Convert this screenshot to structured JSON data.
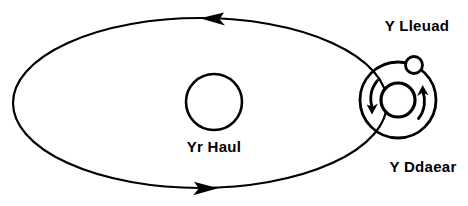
{
  "diagram": {
    "language": "cy",
    "background_color": "#ffffff",
    "stroke_color": "#000000",
    "canvas": {
      "width": 468,
      "height": 206
    },
    "labels": {
      "sun": "Yr Haul",
      "earth": "Y Ddaear",
      "moon": "Y Lleuad"
    },
    "bodies": {
      "sun": {
        "name": "sun",
        "label": "Yr Haul",
        "cx": 214,
        "cy": 102,
        "r": 28,
        "stroke_width": 2.6,
        "label_x": 214,
        "label_y": 152
      },
      "earth": {
        "name": "earth",
        "label": "Y Ddaear",
        "cx": 398,
        "cy": 100,
        "r": 17,
        "stroke_width": 3.2,
        "label_x": 423,
        "label_y": 172
      },
      "moon": {
        "name": "moon",
        "label": "Y Lleuad",
        "cx": 414,
        "cy": 65,
        "r": 8.5,
        "stroke_width": 2.8,
        "label_x": 417,
        "label_y": 31
      }
    },
    "orbits": {
      "earth_orbit": {
        "name": "earth-orbit-ellipse",
        "shape": "ellipse",
        "cx": 200,
        "cy": 103,
        "rx": 187,
        "ry": 85,
        "stroke_width": 2.2,
        "direction": "counterclockwise",
        "arrow_top": {
          "x": 212,
          "y": 18,
          "points": "left"
        },
        "arrow_bottom": {
          "x": 205,
          "y": 188,
          "points": "right"
        }
      },
      "moon_orbit": {
        "name": "moon-orbit-circle",
        "shape": "circle",
        "cx": 398,
        "cy": 100,
        "r": 38,
        "stroke_width": 2.8,
        "direction": "counterclockwise"
      }
    },
    "rotation_arrows": [
      {
        "name": "earth-rotation-arrow-left",
        "side": "left",
        "points": "down",
        "description": "curved arrow on left of Earth pointing downward"
      },
      {
        "name": "earth-rotation-arrow-right",
        "side": "right",
        "points": "up",
        "description": "curved arrow on right of Earth pointing upward"
      }
    ]
  }
}
